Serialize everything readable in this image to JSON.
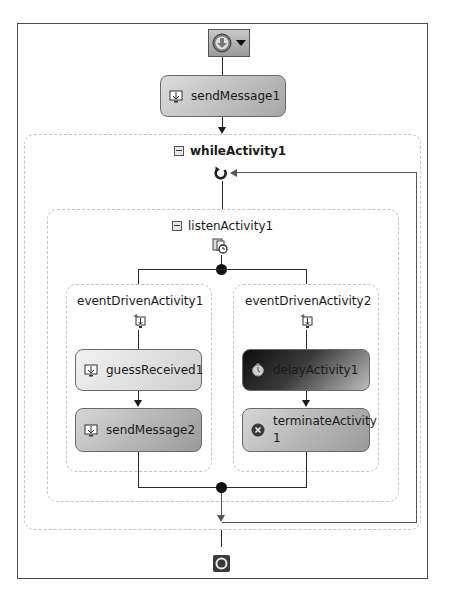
{
  "workflow": {
    "start_button": {
      "icon": "start-arrow-down-icon",
      "dropdown_icon": "triangle-down-icon"
    },
    "activities": {
      "send_message_1": {
        "label": "sendMessage1",
        "icon": "send-message-icon"
      },
      "while_activity": {
        "label": "whileActivity1",
        "collapse_icon": "collapse-minus-icon",
        "loop_icon": "loop-refresh-icon"
      },
      "listen_activity": {
        "label": "listenActivity1",
        "collapse_icon": "collapse-minus-icon",
        "listen_icon": "listen-activity-icon"
      },
      "event_driven_1": {
        "label": "eventDrivenActivity1",
        "icon": "event-driven-icon",
        "children": [
          {
            "label": "guessReceived1",
            "icon": "receive-message-icon"
          },
          {
            "label": "sendMessage2",
            "icon": "send-message-icon"
          }
        ]
      },
      "event_driven_2": {
        "label": "eventDrivenActivity2",
        "icon": "event-driven-icon",
        "children": [
          {
            "label": "delayActivity1",
            "icon": "clock-icon"
          },
          {
            "label": "terminateActivity1",
            "label_line1": "terminateActivity",
            "label_line2": "1",
            "icon": "terminate-x-icon"
          }
        ]
      }
    },
    "end_node": {
      "icon": "end-circle-icon"
    }
  },
  "colors": {
    "frame_border": "#4a4a4a",
    "container_dashed": "#c4c4c4",
    "connector": "#2a2a2a",
    "loop_line": "#555555"
  }
}
